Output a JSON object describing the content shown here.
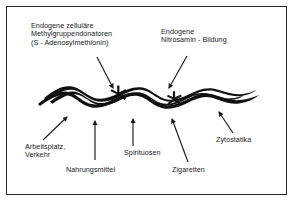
{
  "figure": {
    "border_color": "#2b2b2b",
    "ink_color": "#1a1a1a",
    "background": "#ffffff"
  },
  "top_labels": [
    {
      "id": "methyl",
      "lines": [
        "Endogene zelluläre",
        "Methylgruppendonatoren",
        "(S - Adenosylmethionin)"
      ],
      "text": "Endogene zelluläre\nMethylgruppendonatoren\n(S - Adenosylmethionin)"
    },
    {
      "id": "nitrosamin",
      "lines": [
        "Endogene",
        "Nitrosamin - Bildung"
      ],
      "text": "Endogene\nNitrosamin - Bildung"
    }
  ],
  "bottom_labels": [
    {
      "id": "arbeitsplatz",
      "lines": [
        "Arbeitsplatz,",
        "Verkehr"
      ],
      "text": "Arbeitsplatz,\nVerkehr"
    },
    {
      "id": "nahrungsmittel",
      "lines": [
        "Nahrungsmittel"
      ],
      "text": "Nahrungsmittel"
    },
    {
      "id": "spirituosen",
      "lines": [
        "Spirituosen"
      ],
      "text": "Spirituosen"
    },
    {
      "id": "zigaretten",
      "lines": [
        "Zigaretten"
      ],
      "text": "Zigaretten"
    },
    {
      "id": "zytostatika",
      "lines": [
        "Zytostatika"
      ],
      "text": "Zytostatika"
    }
  ],
  "illustration": {
    "name": "dna-double-helix-ribbon",
    "markers": [
      {
        "name": "star-marker-left",
        "x": 118,
        "y": 94
      },
      {
        "name": "star-marker-right",
        "x": 174,
        "y": 99
      }
    ]
  },
  "arrows": [
    {
      "id": "arrow-methyl",
      "x1": 97,
      "y1": 57,
      "x2": 113,
      "y2": 88
    },
    {
      "id": "arrow-nitrosamin",
      "x1": 187,
      "y1": 56,
      "x2": 169,
      "y2": 88
    },
    {
      "id": "arrow-arbeitsplatz",
      "x1": 43,
      "y1": 140,
      "x2": 67,
      "y2": 117
    },
    {
      "id": "arrow-nahrungsmittel",
      "x1": 95,
      "y1": 160,
      "x2": 95,
      "y2": 122
    },
    {
      "id": "arrow-spirituosen",
      "x1": 133,
      "y1": 146,
      "x2": 133,
      "y2": 120
    },
    {
      "id": "arrow-zigaretten",
      "x1": 188,
      "y1": 162,
      "x2": 172,
      "y2": 120
    },
    {
      "id": "arrow-zytostatika",
      "x1": 233,
      "y1": 133,
      "x2": 219,
      "y2": 113
    }
  ]
}
